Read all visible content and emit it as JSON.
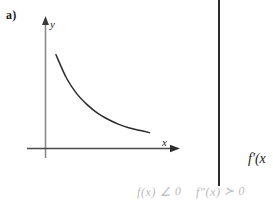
{
  "panel": {
    "label": "a)"
  },
  "chart_data": {
    "type": "line",
    "title": "",
    "xlabel": "x",
    "ylabel": "y",
    "grid": false,
    "legend": null,
    "axes": {
      "x_arrow": true,
      "y_arrow": true,
      "origin_shown": true,
      "tick_labels_x": [],
      "tick_labels_y": [],
      "xlim": [
        0,
        1
      ],
      "ylim": [
        0,
        1
      ]
    },
    "series": [
      {
        "name": "f(x)",
        "x": [
          0.08,
          0.16,
          0.24,
          0.32,
          0.4,
          0.48,
          0.56,
          0.64,
          0.72,
          0.8
        ],
        "y": [
          0.77,
          0.58,
          0.45,
          0.36,
          0.29,
          0.24,
          0.2,
          0.17,
          0.15,
          0.13
        ]
      }
    ]
  },
  "divider": {
    "color": "#2b2b2b"
  },
  "right_panel": {
    "expression": "f′(x"
  },
  "annotations": {
    "left_note": "f(x) ∠ 0",
    "right_note": "f″(x) ≻ 0",
    "color": "#b9b9b9"
  }
}
